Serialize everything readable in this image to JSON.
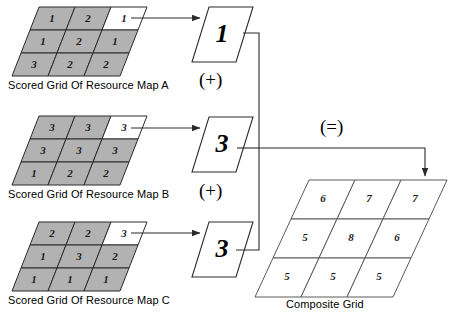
{
  "diagram": {
    "title_hidden": "Resource map score composition diagram",
    "source_grids": [
      {
        "id": "map-a",
        "caption": "Scored Grid Of Resource Map A",
        "rows": [
          [
            "1",
            "2",
            "1"
          ],
          [
            "1",
            "2",
            "1"
          ],
          [
            "3",
            "2",
            "2"
          ]
        ],
        "highlight_cell": {
          "row": 0,
          "col": 2
        },
        "extracted_value": "1"
      },
      {
        "id": "map-b",
        "caption": "Scored Grid Of Resource Map B",
        "rows": [
          [
            "3",
            "3",
            "3"
          ],
          [
            "3",
            "3",
            "3"
          ],
          [
            "1",
            "2",
            "2"
          ]
        ],
        "highlight_cell": {
          "row": 0,
          "col": 2
        },
        "extracted_value": "3"
      },
      {
        "id": "map-c",
        "caption": "Scored Grid Of Resource Map C",
        "rows": [
          [
            "2",
            "2",
            "3"
          ],
          [
            "1",
            "3",
            "2"
          ],
          [
            "1",
            "1",
            "1"
          ]
        ],
        "highlight_cell": {
          "row": 0,
          "col": 2
        },
        "extracted_value": "3"
      }
    ],
    "operators": [
      {
        "id": "plus-1",
        "label": "(+)"
      },
      {
        "id": "plus-2",
        "label": "(+)"
      },
      {
        "id": "equals",
        "label": "(=)"
      }
    ],
    "result_grid": {
      "id": "composite",
      "caption": "Composite Grid",
      "rows": [
        [
          "6",
          "7",
          "7"
        ],
        [
          "5",
          "8",
          "6"
        ],
        [
          "5",
          "5",
          "5"
        ]
      ],
      "target_cell": {
        "row": 0,
        "col": 2
      }
    },
    "colors": {
      "cell_fill": "#b2b2b2",
      "highlight_fill": "#ffffff",
      "stroke": "#2b2b2b",
      "result_fill": "#ffffff",
      "text": "#000000"
    }
  }
}
